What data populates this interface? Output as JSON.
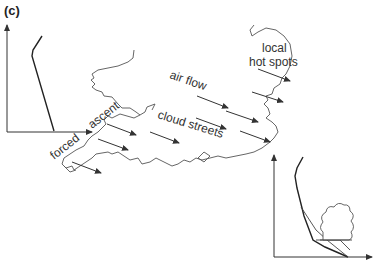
{
  "figure": {
    "panel_label": "(c)",
    "labels": {
      "local": "local",
      "hot_spots": "hot spots",
      "air_flow": "air flow",
      "ascent": "ascent",
      "forced": "forced",
      "cloud_streets": "cloud streets"
    },
    "colors": {
      "line": "#333333",
      "coast": "#555555",
      "background": "#ffffff"
    }
  }
}
